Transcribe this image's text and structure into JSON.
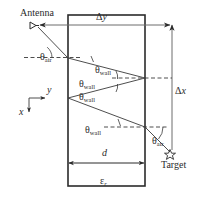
{
  "figure": {
    "type": "ray-trace-diagram",
    "background_color": "#ffffff",
    "line_color": "#3a3a3a",
    "text_color": "#2b2b2b"
  },
  "labels": {
    "antenna": "Antenna",
    "target": "Target",
    "delta_y": "Δ",
    "delta_y_sub": "y",
    "delta_x": "Δ",
    "delta_x_sub": "x",
    "theta": "θ",
    "theta_air_sub": "air",
    "theta_wall_sub": "wall",
    "thickness": "d",
    "permittivity": "ε",
    "permittivity_sub": "r",
    "axis_y": "y",
    "axis_x": "x"
  },
  "angle_labels": [
    {
      "name": "theta-air-antenna",
      "base": "θ",
      "sub": "air",
      "x": 40,
      "y": 47
    },
    {
      "name": "theta-wall-1",
      "base": "θ",
      "sub": "wall",
      "x": 95,
      "y": 60
    },
    {
      "name": "theta-wall-2",
      "base": "θ",
      "sub": "wall",
      "x": 79,
      "y": 74
    },
    {
      "name": "theta-wall-3",
      "base": "θ",
      "sub": "wall",
      "x": 79,
      "y": 87
    },
    {
      "name": "theta-wall-4",
      "base": "θ",
      "sub": "wall",
      "x": 85,
      "y": 120
    },
    {
      "name": "theta-air-target",
      "base": "θ",
      "sub": "air",
      "x": 152,
      "y": 131
    }
  ],
  "geometry": {
    "wall_left_x": 68,
    "wall_right_x": 145,
    "wall_top_y": 15,
    "wall_bottom_y": 186,
    "antenna_x": 38,
    "antenna_y": 25,
    "target_x": 170,
    "target_y": 155,
    "delta_x_line_x": 172,
    "ray_nodes_y": [
      58,
      78,
      98,
      127
    ]
  }
}
